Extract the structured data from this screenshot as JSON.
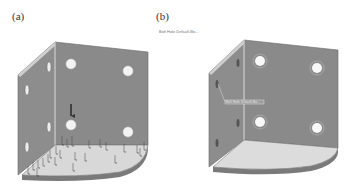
{
  "figure": {
    "panels": [
      {
        "id": "a",
        "label": "(a)",
        "description": "Corner bracket with load arrows on base plate",
        "load_arrow_count_base": 24,
        "highlight_arrow": "downward force on lower-left hole of back plate"
      },
      {
        "id": "b",
        "label": "(b)",
        "feature_tree_label": "Bolt Hole Default-Bo...",
        "dimension_label": "Bolt Hole Default-Bo..."
      }
    ],
    "colors": {
      "plate": "#8a8a8a",
      "plate_edge": "#bdbdbd",
      "base": "#d9d9d9",
      "base_edge": "#6e6e6e",
      "hole": "#f5f5f5",
      "arrow": "#333333",
      "background": "#ffffff"
    }
  }
}
